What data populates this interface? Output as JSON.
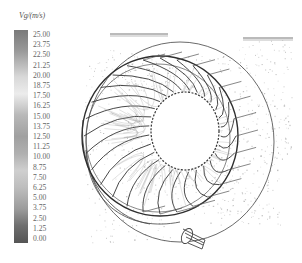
{
  "figure": {
    "legend": {
      "title": "Vg/(m/s)",
      "ticks": [
        "25.00",
        "23.75",
        "22.50",
        "21.25",
        "20.00",
        "18.75",
        "17.50",
        "16.25",
        "15.00",
        "13.75",
        "12.50",
        "11.25",
        "10.00",
        "8.75",
        "7.50",
        "6.25",
        "5.00",
        "3.75",
        "2.50",
        "1.25",
        "0.00"
      ],
      "min": 0.0,
      "max": 25.0,
      "colormap": [
        {
          "stop": 0.0,
          "color": "#7a7a7a"
        },
        {
          "stop": 0.1,
          "color": "#9a9a9a"
        },
        {
          "stop": 0.22,
          "color": "#d8d8d8"
        },
        {
          "stop": 0.3,
          "color": "#ececec"
        },
        {
          "stop": 0.4,
          "color": "#b8b8b8"
        },
        {
          "stop": 0.5,
          "color": "#a0a0a0"
        },
        {
          "stop": 0.58,
          "color": "#b0b0b0"
        },
        {
          "stop": 0.66,
          "color": "#cfcfcf"
        },
        {
          "stop": 0.74,
          "color": "#bdbdbd"
        },
        {
          "stop": 0.84,
          "color": "#9c9c9c"
        },
        {
          "stop": 0.92,
          "color": "#6e6e6e"
        },
        {
          "stop": 1.0,
          "color": "#555555"
        }
      ]
    },
    "components": [
      "inlet-plate-left",
      "inlet-plate-right",
      "outer-casing",
      "runner-blades",
      "runner-hub-opening",
      "outlet-pipe"
    ],
    "colors": {
      "line": "#3a3a3a",
      "particles": "#9a9a9a",
      "background": "#ffffff"
    }
  }
}
